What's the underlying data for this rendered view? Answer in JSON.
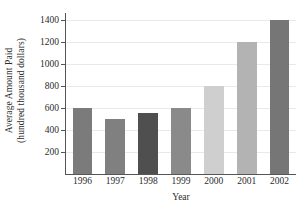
{
  "chart_data": {
    "type": "bar",
    "title": "",
    "categories": [
      "1996",
      "1997",
      "1998",
      "1999",
      "2000",
      "2001",
      "2002"
    ],
    "values": [
      600,
      500,
      550,
      600,
      800,
      1200,
      1400
    ],
    "xlabel": "Year",
    "ylabel_line1": "Average Amount Paid",
    "ylabel_line2": "(hundred thousand dollars)",
    "ylim": [
      0,
      1450
    ],
    "yticks": [
      200,
      400,
      600,
      800,
      1000,
      1200,
      1400
    ],
    "ytick_labels": [
      "200",
      "400",
      "600",
      "800",
      "1000",
      "1200",
      "1400"
    ],
    "grid": true,
    "legend": "none",
    "bar_colors": [
      "#7b7b7b",
      "#808080",
      "#4f4f4f",
      "#8a8a8a",
      "#cfcfcf",
      "#b3b3b3",
      "#767676"
    ],
    "axis_color": "#555555",
    "grid_color": "#e9e9e9",
    "background": "#ffffff"
  }
}
